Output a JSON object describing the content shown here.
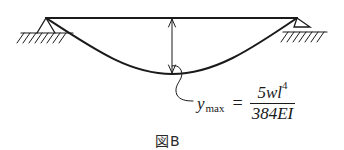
{
  "diagram": {
    "type": "simply-supported-beam-deflection",
    "formula": {
      "lhs_symbol": "y",
      "lhs_subscript": "max",
      "equals": "=",
      "numerator": "5wl",
      "numerator_exponent": "4",
      "denominator": "384EI"
    },
    "caption": "図B",
    "colors": {
      "line": "#1a1a1a",
      "background": "#ffffff"
    }
  }
}
